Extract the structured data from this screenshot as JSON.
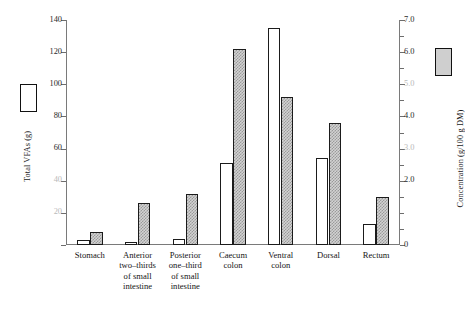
{
  "chart_data": {
    "type": "bar",
    "title": "",
    "categories": [
      "Stomach",
      "Anterior two–thirds of small intestine",
      "Posterior one–third of small intestine",
      "Caecum colon",
      "Ventral colon",
      "Dorsal",
      "Rectum"
    ],
    "series": [
      {
        "name": "Total VFAs (g)",
        "axis": "left",
        "style": "open",
        "values": [
          3,
          2,
          4,
          51,
          135,
          54,
          13
        ]
      },
      {
        "name": "Concentration (g/100 g DM)",
        "axis": "right",
        "style": "shaded",
        "values": [
          0.4,
          1.3,
          1.6,
          6.1,
          4.6,
          3.8,
          1.5
        ]
      }
    ],
    "xlabel": "",
    "ylabel": "Total VFAs (g)",
    "y2label": "Concentration (g/100 g DM)",
    "ylim": [
      0,
      140
    ],
    "y2lim": [
      0,
      7.0
    ],
    "grid": false,
    "legend": "axis-side-keys"
  },
  "left_axis": {
    "title": "Total VFAs (g)",
    "ticks": [
      {
        "value": 140,
        "label": "140",
        "faded": false
      },
      {
        "value": 120,
        "label": "120",
        "faded": false
      },
      {
        "value": 100,
        "label": "100",
        "faded": false
      },
      {
        "value": 80,
        "label": "80",
        "faded": false
      },
      {
        "value": 60,
        "label": "60",
        "faded": false
      },
      {
        "value": 40,
        "label": "40",
        "faded": true
      },
      {
        "value": 20,
        "label": "20",
        "faded": true
      },
      {
        "value": 0,
        "label": "",
        "faded": false
      }
    ]
  },
  "right_axis": {
    "title": "Concentration (g/100 g DM)",
    "ticks": [
      {
        "value": 7.0,
        "label": "7.0",
        "faded": false
      },
      {
        "value": 6.5,
        "label": "",
        "faded": false
      },
      {
        "value": 6.0,
        "label": "6.0",
        "faded": false
      },
      {
        "value": 5.5,
        "label": "",
        "faded": false
      },
      {
        "value": 5.0,
        "label": "5.0",
        "faded": true
      },
      {
        "value": 4.5,
        "label": "",
        "faded": false
      },
      {
        "value": 4.0,
        "label": "4.0",
        "faded": false
      },
      {
        "value": 3.5,
        "label": "",
        "faded": false
      },
      {
        "value": 3.0,
        "label": "3.0",
        "faded": true
      },
      {
        "value": 2.5,
        "label": "",
        "faded": false
      },
      {
        "value": 2.0,
        "label": "2.0",
        "faded": false
      },
      {
        "value": 1.5,
        "label": "",
        "faded": false
      },
      {
        "value": 1.0,
        "label": "",
        "faded": true
      },
      {
        "value": 0.5,
        "label": "",
        "faded": false
      },
      {
        "value": 0.0,
        "label": "0",
        "faded": false
      }
    ]
  },
  "categories": [
    {
      "line1": "Stomach",
      "line2": "",
      "line3": "",
      "line4": ""
    },
    {
      "line1": "Anterior",
      "line2": "two–thirds",
      "line3": "of small",
      "line4": "intestine"
    },
    {
      "line1": "Posterior",
      "line2": "one–third",
      "line3": "of small",
      "line4": "intestine"
    },
    {
      "line1": "Caecum",
      "line2": "colon",
      "line3": "",
      "line4": ""
    },
    {
      "line1": "Ventral",
      "line2": "colon",
      "line3": "",
      "line4": ""
    },
    {
      "line1": "Dorsal",
      "line2": "",
      "line3": "",
      "line4": ""
    },
    {
      "line1": "Rectum",
      "line2": "",
      "line3": "",
      "line4": ""
    }
  ],
  "colors": {
    "open_bar_fill": "#ffffff",
    "shaded_bar_fill": "#d2d2d2",
    "bar_outline": "#1b1b1b",
    "axis_line": "#7a7a7a",
    "text": "#151515"
  }
}
